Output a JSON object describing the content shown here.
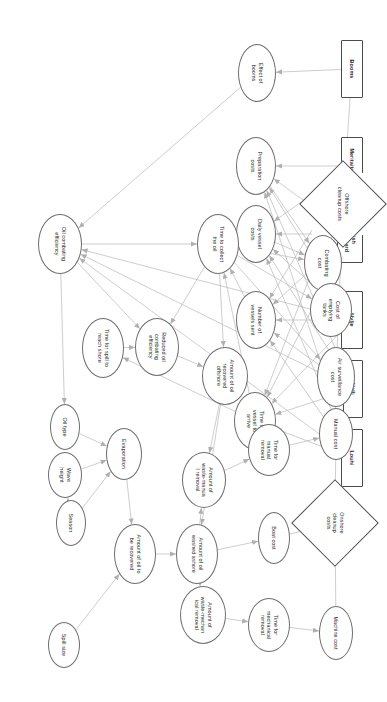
{
  "diagram": {
    "type": "influence-diagram",
    "orientation_degrees": 90,
    "colors": {
      "edge": "#b8b8b8",
      "node_border": "#5a5a5a",
      "text": "#2a2a2a",
      "background": "#ffffff"
    },
    "nodes": [
      {
        "id": "booms",
        "label": "Booms",
        "shape": "rect",
        "x": 40,
        "y": 23,
        "w": 58,
        "h": 22
      },
      {
        "id": "meritaito",
        "label": "Meritaito Ltd.",
        "shape": "rect",
        "x": 137,
        "y": 23,
        "w": 58,
        "h": 22
      },
      {
        "id": "borderguard",
        "label": "Finnish\nBorder Guard",
        "shape": "rect",
        "x": 205,
        "y": 23,
        "w": 58,
        "h": 26
      },
      {
        "id": "hylje",
        "label": "Hylje",
        "shape": "rect",
        "x": 291,
        "y": 23,
        "w": 58,
        "h": 22
      },
      {
        "id": "halli",
        "label": "Halli",
        "shape": "rect",
        "x": 360,
        "y": 23,
        "w": 58,
        "h": 20
      },
      {
        "id": "louhi",
        "label": "Louhi",
        "shape": "rect",
        "x": 429,
        "y": 23,
        "w": 58,
        "h": 22
      },
      {
        "id": "effectbooms",
        "label": "Effect of\nbooms",
        "shape": "ellipse",
        "x": 44,
        "y": 110,
        "w": 58,
        "h": 38
      },
      {
        "id": "prepcosts",
        "label": "Preparation\ncosts",
        "shape": "ellipse",
        "x": 137,
        "y": 110,
        "w": 58,
        "h": 40
      },
      {
        "id": "dailyvessel",
        "label": "Daily vessel\ncosts",
        "shape": "ellipse",
        "x": 205,
        "y": 110,
        "w": 58,
        "h": 40
      },
      {
        "id": "numvessels",
        "label": "Number of\nvessels sent",
        "shape": "ellipse",
        "x": 291,
        "y": 110,
        "w": 58,
        "h": 40
      },
      {
        "id": "timearrive",
        "label": "Time for\nvessel to\narrive",
        "shape": "ellipse",
        "x": 392,
        "y": 110,
        "w": 58,
        "h": 42
      },
      {
        "id": "offshorecost",
        "label": "Offshore\ncleanup costs",
        "shape": "diamond",
        "x": 173,
        "y": 12,
        "w": 62,
        "h": 62
      },
      {
        "id": "combatcost",
        "label": "Combating\ncost",
        "shape": "ellipse",
        "x": 235,
        "y": 44,
        "w": 56,
        "h": 38
      },
      {
        "id": "emptytanks",
        "label": "Cost of\nemptying\ntanks",
        "shape": "ellipse",
        "x": 283,
        "y": 34,
        "w": 54,
        "h": 42
      },
      {
        "id": "airsurv",
        "label": "Air surveillance\ncost",
        "shape": "ellipse",
        "x": 347,
        "y": 31,
        "w": 60,
        "h": 38
      },
      {
        "id": "timecollect",
        "label": "Time to collect\nthe oil",
        "shape": "ellipse",
        "x": 214,
        "y": 147,
        "w": 60,
        "h": 42
      },
      {
        "id": "oilcombateff",
        "label": "Oil combating\nefficiency",
        "shape": "ellipse",
        "x": 214,
        "y": 304,
        "w": 60,
        "h": 44
      },
      {
        "id": "reducedeff",
        "label": "Reduced oil\ncombating\nefficiency",
        "shape": "ellipse",
        "x": 318,
        "y": 207,
        "w": 58,
        "h": 44
      },
      {
        "id": "timetoshore",
        "label": "Time for spill to\nreach shore",
        "shape": "ellipse",
        "x": 318,
        "y": 262,
        "w": 60,
        "h": 42
      },
      {
        "id": "amtoffshore",
        "label": "Amount of oil\nrecovered\noffshore",
        "shape": "ellipse",
        "x": 347,
        "y": 138,
        "w": 58,
        "h": 46
      },
      {
        "id": "oiltype",
        "label": "Oil type",
        "shape": "ellipse",
        "x": 404,
        "y": 306,
        "w": 46,
        "h": 30
      },
      {
        "id": "evaporation",
        "label": "Evaporation",
        "shape": "ellipse",
        "x": 428,
        "y": 244,
        "w": 52,
        "h": 36
      },
      {
        "id": "waveheight",
        "label": "Wave\nheight",
        "shape": "ellipse",
        "x": 452,
        "y": 304,
        "w": 46,
        "h": 34
      },
      {
        "id": "season",
        "label": "Season",
        "shape": "ellipse",
        "x": 500,
        "y": 300,
        "w": 46,
        "h": 30
      },
      {
        "id": "amttorecover",
        "label": "Amount of oil to\nbe recovered",
        "shape": "ellipse",
        "x": 524,
        "y": 230,
        "w": 60,
        "h": 42
      },
      {
        "id": "washedashore",
        "label": "Amount of oil\nwashed ashore",
        "shape": "ellipse",
        "x": 524,
        "y": 168,
        "w": 60,
        "h": 42
      },
      {
        "id": "spillsize",
        "label": "Spill size",
        "shape": "ellipse",
        "x": 622,
        "y": 306,
        "w": 46,
        "h": 32
      },
      {
        "id": "onshorecost",
        "label": "Onshore\ncleanup\ncosts",
        "shape": "diamond",
        "x": 492,
        "y": 20,
        "w": 62,
        "h": 62
      },
      {
        "id": "manualcost",
        "label": "Manual cost",
        "shape": "ellipse",
        "x": 408,
        "y": 33,
        "w": 52,
        "h": 34
      },
      {
        "id": "timemanual",
        "label": "Time for\nmanual\nremoval",
        "shape": "ellipse",
        "x": 424,
        "y": 96,
        "w": 52,
        "h": 42
      },
      {
        "id": "wastemanual",
        "label": "Amount of\nwaste-manua\nl removal",
        "shape": "ellipse",
        "x": 452,
        "y": 160,
        "w": 56,
        "h": 44
      },
      {
        "id": "boatcost",
        "label": "Boat cost",
        "shape": "ellipse",
        "x": 512,
        "y": 96,
        "w": 52,
        "h": 32
      },
      {
        "id": "machinecost",
        "label": "Machine cost",
        "shape": "ellipse",
        "x": 606,
        "y": 33,
        "w": 54,
        "h": 34
      },
      {
        "id": "timemech",
        "label": "Time for\nmechanical\nremoval",
        "shape": "ellipse",
        "x": 598,
        "y": 96,
        "w": 54,
        "h": 42
      },
      {
        "id": "wastemech",
        "label": "Amount of\nwaste-mechan\nical removal",
        "shape": "ellipse",
        "x": 586,
        "y": 160,
        "w": 58,
        "h": 46
      }
    ],
    "edges": [
      [
        "booms",
        "effectbooms"
      ],
      [
        "booms",
        "offshorecost"
      ],
      [
        "meritaito",
        "prepcosts"
      ],
      [
        "meritaito",
        "dailyvessel"
      ],
      [
        "meritaito",
        "numvessels"
      ],
      [
        "meritaito",
        "timearrive"
      ],
      [
        "borderguard",
        "prepcosts"
      ],
      [
        "borderguard",
        "dailyvessel"
      ],
      [
        "borderguard",
        "numvessels"
      ],
      [
        "borderguard",
        "timearrive"
      ],
      [
        "hylje",
        "prepcosts"
      ],
      [
        "hylje",
        "dailyvessel"
      ],
      [
        "hylje",
        "numvessels"
      ],
      [
        "hylje",
        "timearrive"
      ],
      [
        "hylje",
        "oilcombateff"
      ],
      [
        "halli",
        "prepcosts"
      ],
      [
        "halli",
        "dailyvessel"
      ],
      [
        "halli",
        "numvessels"
      ],
      [
        "halli",
        "timearrive"
      ],
      [
        "halli",
        "oilcombateff"
      ],
      [
        "louhi",
        "prepcosts"
      ],
      [
        "louhi",
        "dailyvessel"
      ],
      [
        "louhi",
        "numvessels"
      ],
      [
        "louhi",
        "timearrive"
      ],
      [
        "louhi",
        "oilcombateff"
      ],
      [
        "effectbooms",
        "oilcombateff"
      ],
      [
        "prepcosts",
        "combatcost"
      ],
      [
        "dailyvessel",
        "combatcost"
      ],
      [
        "numvessels",
        "timecollect"
      ],
      [
        "timearrive",
        "timecollect"
      ],
      [
        "timearrive",
        "timetoshore"
      ],
      [
        "timecollect",
        "combatcost"
      ],
      [
        "timecollect",
        "emptytanks"
      ],
      [
        "timecollect",
        "airsurv"
      ],
      [
        "timecollect",
        "amtoffshore"
      ],
      [
        "timecollect",
        "reducedeff"
      ],
      [
        "oilcombateff",
        "timecollect"
      ],
      [
        "oilcombateff",
        "reducedeff"
      ],
      [
        "oilcombateff",
        "oiltype"
      ],
      [
        "reducedeff",
        "amtoffshore"
      ],
      [
        "timetoshore",
        "reducedeff"
      ],
      [
        "combatcost",
        "offshorecost"
      ],
      [
        "emptytanks",
        "offshorecost"
      ],
      [
        "airsurv",
        "offshorecost"
      ],
      [
        "amtoffshore",
        "washedashore"
      ],
      [
        "amtoffshore",
        "wastemanual"
      ],
      [
        "oiltype",
        "evaporation"
      ],
      [
        "waveheight",
        "evaporation"
      ],
      [
        "season",
        "waveheight"
      ],
      [
        "season",
        "evaporation"
      ],
      [
        "evaporation",
        "amttorecover"
      ],
      [
        "amttorecover",
        "washedashore"
      ],
      [
        "spillsize",
        "amttorecover"
      ],
      [
        "washedashore",
        "wastemanual"
      ],
      [
        "washedashore",
        "wastemech"
      ],
      [
        "wastemanual",
        "timemanual"
      ],
      [
        "timemanual",
        "manualcost"
      ],
      [
        "manualcost",
        "onshorecost"
      ],
      [
        "wastemech",
        "timemech"
      ],
      [
        "timemech",
        "machinecost"
      ],
      [
        "machinecost",
        "onshorecost"
      ],
      [
        "boatcost",
        "onshorecost"
      ],
      [
        "washedashore",
        "boatcost"
      ]
    ]
  }
}
